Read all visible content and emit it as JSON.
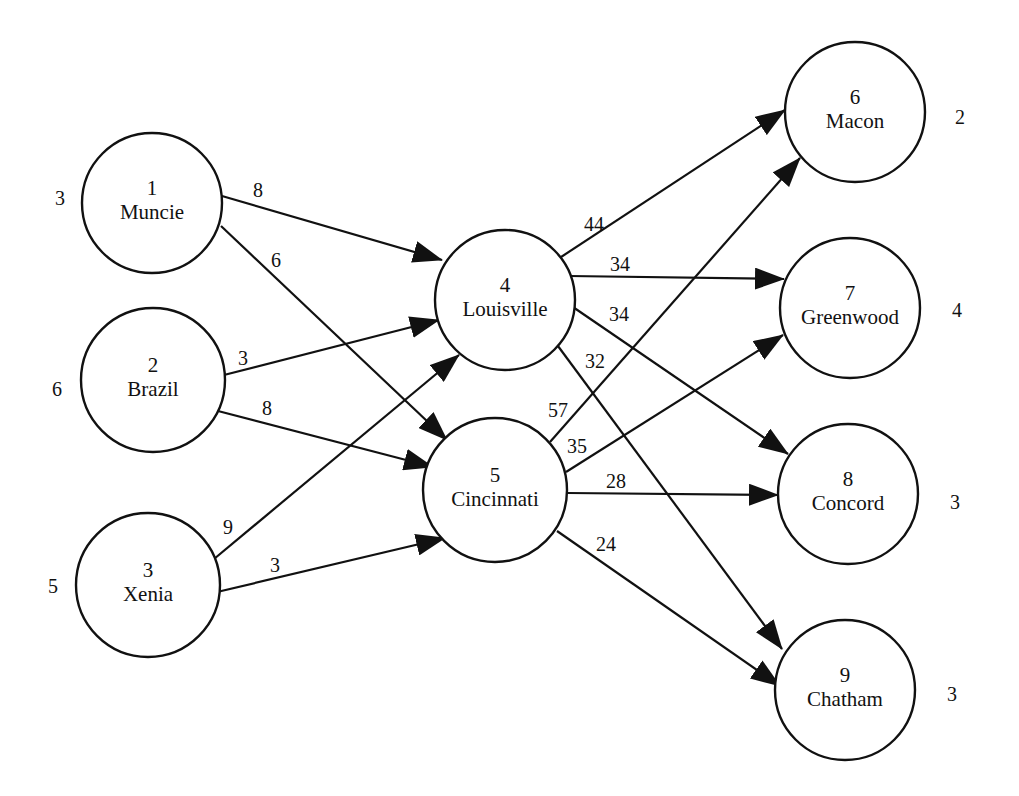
{
  "diagram": {
    "type": "transshipment-network",
    "colors": {
      "stroke": "#111111",
      "background": "#ffffff"
    },
    "nodes": [
      {
        "id": "1",
        "name": "Muncie",
        "cx": 152,
        "cy": 203,
        "r": 70,
        "side_value": "3",
        "side_x": 60,
        "side_y": 198
      },
      {
        "id": "2",
        "name": "Brazil",
        "cx": 153,
        "cy": 380,
        "r": 72,
        "side_value": "6",
        "side_x": 57,
        "side_y": 389
      },
      {
        "id": "3",
        "name": "Xenia",
        "cx": 148,
        "cy": 585,
        "r": 72,
        "side_value": "5",
        "side_x": 53,
        "side_y": 586
      },
      {
        "id": "4",
        "name": "Louisville",
        "cx": 505,
        "cy": 300,
        "r": 70,
        "side_value": "",
        "side_x": 0,
        "side_y": 0
      },
      {
        "id": "5",
        "name": "Cincinnati",
        "cx": 495,
        "cy": 490,
        "r": 72,
        "side_value": "",
        "side_x": 0,
        "side_y": 0
      },
      {
        "id": "6",
        "name": "Macon",
        "cx": 855,
        "cy": 112,
        "r": 70,
        "side_value": "2",
        "side_x": 960,
        "side_y": 117
      },
      {
        "id": "7",
        "name": "Greenwood",
        "cx": 850,
        "cy": 308,
        "r": 70,
        "side_value": "4",
        "side_x": 957,
        "side_y": 310
      },
      {
        "id": "8",
        "name": "Concord",
        "cx": 848,
        "cy": 494,
        "r": 70,
        "side_value": "3",
        "side_x": 955,
        "side_y": 502
      },
      {
        "id": "9",
        "name": "Chatham",
        "cx": 845,
        "cy": 690,
        "r": 70,
        "side_value": "3",
        "side_x": 952,
        "side_y": 694
      }
    ],
    "edges": [
      {
        "from": "1",
        "to": "4",
        "label": "8",
        "x1": 222,
        "y1": 196,
        "x2": 442,
        "y2": 260,
        "lx": 258,
        "ly": 190
      },
      {
        "from": "1",
        "to": "5",
        "label": "6",
        "x1": 221,
        "y1": 226,
        "x2": 447,
        "y2": 440,
        "lx": 276,
        "ly": 260
      },
      {
        "from": "2",
        "to": "4",
        "label": "3",
        "x1": 220,
        "y1": 376,
        "x2": 439,
        "y2": 320,
        "lx": 243,
        "ly": 358
      },
      {
        "from": "2",
        "to": "5",
        "label": "8",
        "x1": 218,
        "y1": 411,
        "x2": 433,
        "y2": 467,
        "lx": 267,
        "ly": 408
      },
      {
        "from": "3",
        "to": "4",
        "label": "9",
        "x1": 214,
        "y1": 559,
        "x2": 459,
        "y2": 355,
        "lx": 228,
        "ly": 527
      },
      {
        "from": "3",
        "to": "5",
        "label": "3",
        "x1": 217,
        "y1": 592,
        "x2": 445,
        "y2": 538,
        "lx": 275,
        "ly": 565
      },
      {
        "from": "4",
        "to": "6",
        "label": "44",
        "x1": 558,
        "y1": 259,
        "x2": 785,
        "y2": 110,
        "lx": 594,
        "ly": 224
      },
      {
        "from": "4",
        "to": "7",
        "label": "34",
        "x1": 569,
        "y1": 276,
        "x2": 784,
        "y2": 279,
        "lx": 620,
        "ly": 264
      },
      {
        "from": "4",
        "to": "8",
        "label": "34",
        "x1": 570,
        "y1": 305,
        "x2": 788,
        "y2": 454,
        "lx": 619,
        "ly": 314
      },
      {
        "from": "4",
        "to": "9",
        "label": "32",
        "x1": 555,
        "y1": 342,
        "x2": 782,
        "y2": 649,
        "lx": 595,
        "ly": 361
      },
      {
        "from": "5",
        "to": "6",
        "label": "57",
        "x1": 550,
        "y1": 442,
        "x2": 800,
        "y2": 158,
        "lx": 558,
        "ly": 410
      },
      {
        "from": "5",
        "to": "7",
        "label": "35",
        "x1": 566,
        "y1": 472,
        "x2": 783,
        "y2": 335,
        "lx": 577,
        "ly": 446
      },
      {
        "from": "5",
        "to": "8",
        "label": "28",
        "x1": 568,
        "y1": 493,
        "x2": 778,
        "y2": 495,
        "lx": 616,
        "ly": 481
      },
      {
        "from": "5",
        "to": "9",
        "label": "24",
        "x1": 557,
        "y1": 531,
        "x2": 780,
        "y2": 686,
        "lx": 606,
        "ly": 544
      }
    ]
  }
}
